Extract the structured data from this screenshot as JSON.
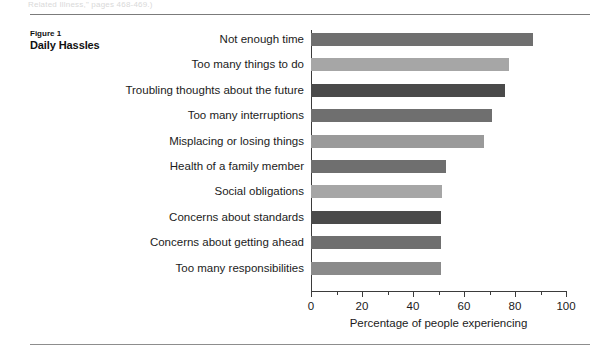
{
  "page": {
    "running_head": "Related Illness,\" pages 468-469.)",
    "rule_top": "horizontal-rule",
    "rule_bottom": "horizontal-rule"
  },
  "caption": {
    "number": "Figure 1",
    "title": "Daily Hassles"
  },
  "chart_data": {
    "type": "bar",
    "orientation": "horizontal",
    "title": "Daily Hassles",
    "xlabel": "Percentage of people experiencing",
    "ylabel": "",
    "xlim": [
      0,
      100
    ],
    "xticks": [
      0,
      20,
      40,
      60,
      80,
      100
    ],
    "xtick_labels": [
      "0",
      "20",
      "40",
      "60",
      "80",
      "100"
    ],
    "minor_tick_step": 10,
    "grid": false,
    "legend": "none",
    "categories": [
      "Not enough time",
      "Too many things to do",
      "Troubling thoughts about the future",
      "Too many interruptions",
      "Misplacing or losing things",
      "Health of a family member",
      "Social obligations",
      "Concerns about standards",
      "Concerns about getting ahead",
      "Too many responsibilities"
    ],
    "values": [
      87,
      77.5,
      76,
      71,
      68,
      53,
      51.5,
      51,
      51,
      51
    ],
    "bar_colors": [
      "#6f6f6f",
      "#a6a6a6",
      "#4a4a4a",
      "#6f6f6f",
      "#9a9a9a",
      "#6f6f6f",
      "#a6a6a6",
      "#4a4a4a",
      "#6f6f6f",
      "#8a8a8a"
    ]
  }
}
